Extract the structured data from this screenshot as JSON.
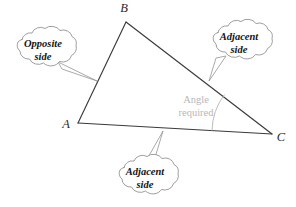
{
  "figure": {
    "type": "geometry-diagram",
    "background_color": "#ffffff",
    "triangle": {
      "stroke_color": "#3a3a3a",
      "vertices": [
        {
          "name": "A",
          "label": "A",
          "x": 78,
          "y": 123,
          "label_x": 66,
          "label_y": 128
        },
        {
          "name": "B",
          "label": "B",
          "x": 126,
          "y": 22,
          "label_x": 124,
          "label_y": 12
        },
        {
          "name": "C",
          "label": "C",
          "x": 272,
          "y": 134,
          "label_x": 281,
          "label_y": 141
        }
      ],
      "sides": [
        {
          "name": "AB",
          "from": "A",
          "to": "B",
          "role": "opposite side"
        },
        {
          "name": "BC",
          "from": "B",
          "to": "C",
          "role": "adjacent side"
        },
        {
          "name": "AC",
          "from": "A",
          "to": "C",
          "role": "adjacent side"
        }
      ]
    },
    "angle_marker": {
      "at_vertex": "C",
      "line1": "Angle",
      "line2": "required",
      "text_color": "#b7b7b7",
      "arc_color": "#bdbdbd",
      "text_x": 196,
      "text_y_line1": 103,
      "text_y_line2": 116
    },
    "callouts": [
      {
        "id": "opposite-side-callout",
        "line1": "Opposite",
        "line2": "side",
        "points_to_side": "AB",
        "center_x": 43,
        "center_y": 50,
        "text_x": 43,
        "text_y_line1": 47,
        "text_y_line2": 60,
        "tip_x": 97,
        "tip_y": 81
      },
      {
        "id": "adjacent-side-callout-top",
        "line1": "Adjacent",
        "line2": "side",
        "points_to_side": "BC",
        "center_x": 239,
        "center_y": 43,
        "text_x": 239,
        "text_y_line1": 40,
        "text_y_line2": 53,
        "tip_x": 209,
        "tip_y": 81
      },
      {
        "id": "adjacent-side-callout-bottom",
        "line1": "Adjacent",
        "line2": "side",
        "points_to_side": "AC",
        "center_x": 145,
        "center_y": 178,
        "text_x": 145,
        "text_y_line1": 175,
        "text_y_line2": 188,
        "tip_x": 163,
        "tip_y": 131
      }
    ]
  }
}
